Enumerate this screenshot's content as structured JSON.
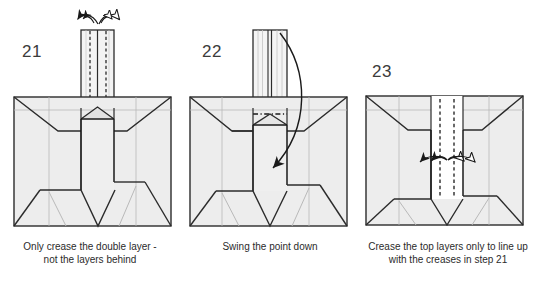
{
  "document": {
    "title": "Origami folding instructions steps 21-23",
    "background_color": "#ffffff",
    "line_color": "#2b2b2b",
    "paper_fill": "#ededed",
    "paper_fill_light": "#f5f5f5",
    "paper_fill_white": "#ffffff",
    "ghost_crease_color": "#b9b9b9"
  },
  "panels": [
    {
      "id": "panel-21",
      "step_number": "21",
      "caption_line_1": "Only crease the double layer -",
      "caption_line_2": "not the layers behind",
      "state": "stem-up-with-creases",
      "arrows": [
        {
          "name": "fold-arrow-left",
          "head": "filled",
          "direction": "left"
        },
        {
          "name": "unfold-arrow-right",
          "head": "hollow",
          "direction": "right"
        }
      ],
      "crease_lines": [
        "dashed-left",
        "dashed-right"
      ],
      "notes": "Vertical stem protrudes above the body with two dashed valley creases and a solid centre edge."
    },
    {
      "id": "panel-22",
      "step_number": "22",
      "caption_line_1": "Swing the point down",
      "caption_line_2": "",
      "state": "stem-up-layers-visible",
      "arrows": [
        {
          "name": "swing-down-arrow",
          "head": "filled",
          "direction": "down-left"
        }
      ],
      "crease_lines": [
        "dash-dot-horizontal"
      ],
      "notes": "Curved arrow from top of stem swinging down into the body."
    },
    {
      "id": "panel-23",
      "step_number": "23",
      "caption_line_1": "Crease the top layers only to line up",
      "caption_line_2": "with the creases in step 21",
      "state": "point-swung-down",
      "arrows": [
        {
          "name": "fold-arrow-left-outer",
          "head": "filled",
          "direction": "left"
        },
        {
          "name": "fold-arrow-left-inner",
          "head": "filled",
          "direction": "left"
        },
        {
          "name": "unfold-arrow-right-inner",
          "head": "hollow",
          "direction": "right"
        },
        {
          "name": "unfold-arrow-right-outer",
          "head": "hollow",
          "direction": "right"
        }
      ],
      "crease_lines": [
        "dashed-left",
        "dashed-right"
      ],
      "notes": "Stem is folded down; white centre panel with two dashed creases and four arrowheads."
    }
  ]
}
